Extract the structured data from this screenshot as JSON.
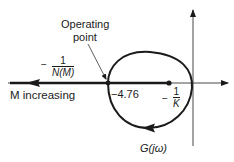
{
  "diagram": {
    "labels": {
      "operating_point_line1": "Operating",
      "operating_point_line2": "point",
      "neg_inv_N": {
        "sign": "−",
        "numerator": "1",
        "denominator": "N(M)"
      },
      "m_increasing": "M increasing",
      "crossing_value": "−4.76",
      "neg_inv_K": {
        "sign": "−",
        "numerator": "1",
        "denominator": "K"
      },
      "g_jw": "G(jω)"
    },
    "colors": {
      "stroke": "#1a1a1a",
      "background": "#ffffff"
    }
  }
}
